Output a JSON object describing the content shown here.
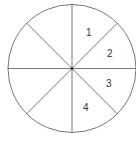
{
  "diagram": {
    "type": "circle-divided-into-sectors",
    "sectors": 8,
    "line_color": "#555555",
    "labels": [
      {
        "text": "1",
        "x": 86,
        "y": 36
      },
      {
        "text": "2",
        "x": 107,
        "y": 57
      },
      {
        "text": "3",
        "x": 106,
        "y": 87
      },
      {
        "text": "4",
        "x": 84,
        "y": 111
      }
    ]
  }
}
